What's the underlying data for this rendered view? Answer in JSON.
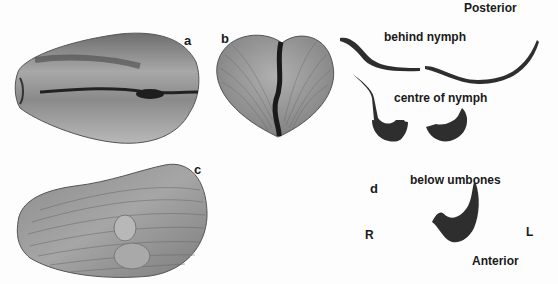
{
  "figure": {
    "panels": {
      "a": {
        "label": "a",
        "description": "dorsal view of elongate bivalve shell"
      },
      "b": {
        "label": "b",
        "description": "end view of heart-shaped shell"
      },
      "c": {
        "label": "c",
        "description": "lateral view of shell with two oval patches"
      },
      "d": {
        "label": "d",
        "description": "serial sections of hinge region"
      }
    },
    "section_labels": {
      "posterior": "Posterior",
      "behind_nymph": "behind nymph",
      "centre_of_nymph": "centre of nymph",
      "below_umbones": "below umbones",
      "anterior": "Anterior",
      "right": "R",
      "left": "L"
    },
    "colors": {
      "background": "#fdfdfd",
      "shell_mid": "#9a9a9a",
      "shell_light": "#c4c4c4",
      "section_dark": "#2e2e2e",
      "text": "#1a1a1a"
    }
  }
}
